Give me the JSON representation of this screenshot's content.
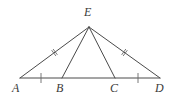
{
  "figure": {
    "type": "geometry-diagram",
    "background_color": "#ffffff",
    "stroke_color": "#4a4a4a",
    "mark_color": "#6a6a6a",
    "label_color": "#3a3a3a",
    "canvas": {
      "width": 180,
      "height": 105
    },
    "points": [
      {
        "name": "A",
        "label": "A",
        "x": 20,
        "y": 78,
        "label_x": 12,
        "label_y": 82
      },
      {
        "name": "B",
        "label": "B",
        "x": 62,
        "y": 78,
        "label_x": 56,
        "label_y": 82
      },
      {
        "name": "C",
        "label": "C",
        "x": 115,
        "y": 78,
        "label_x": 110,
        "label_y": 82
      },
      {
        "name": "D",
        "label": "D",
        "x": 160,
        "y": 78,
        "label_x": 155,
        "label_y": 82
      },
      {
        "name": "E",
        "label": "E",
        "x": 89,
        "y": 27,
        "label_x": 84,
        "label_y": 6
      }
    ],
    "segments": [
      {
        "name": "segment-AE",
        "from": "A",
        "to": "E",
        "marks": 2,
        "role": "edge"
      },
      {
        "name": "segment-ED",
        "from": "E",
        "to": "D",
        "marks": 2,
        "role": "edge"
      },
      {
        "name": "segment-AD",
        "from": "A",
        "to": "D",
        "marks": 0,
        "role": "base"
      },
      {
        "name": "segment-EB",
        "from": "E",
        "to": "B",
        "marks": 0,
        "role": "cevian"
      },
      {
        "name": "segment-EC",
        "from": "E",
        "to": "C",
        "marks": 0,
        "role": "cevian"
      }
    ],
    "base_ticks": [
      {
        "name": "tick-AB",
        "on": "AB",
        "x": 41,
        "y": 78,
        "marks": 1
      },
      {
        "name": "tick-CD",
        "on": "CD",
        "x": 138,
        "y": 78,
        "marks": 1
      }
    ],
    "side_hashes": [
      {
        "name": "hash-AE",
        "on": "AE",
        "x": 53.5,
        "y": 51.5,
        "marks": 2
      },
      {
        "name": "hash-ED",
        "on": "ED",
        "x": 125.5,
        "y": 51.5,
        "marks": 2
      }
    ],
    "geometry_notes": {
      "congruent_sides": "AE = ED (double hash marks)",
      "congruent_base_segments": "AB = CD (single tick marks)"
    }
  }
}
